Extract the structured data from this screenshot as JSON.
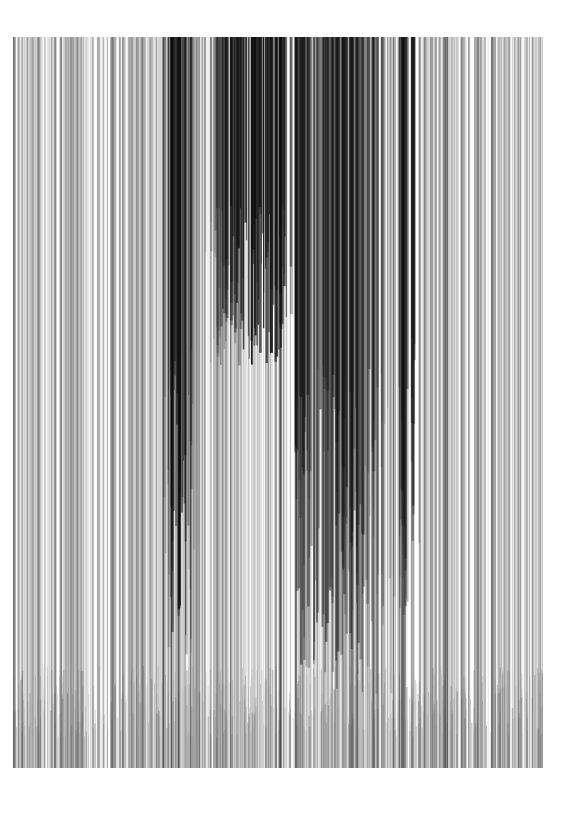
{
  "artwork": {
    "title": "",
    "background": "#ffffff",
    "frame": {
      "x": 13,
      "y": 37,
      "width": 530,
      "height": 731
    },
    "line_count": 900,
    "seed": 7,
    "dark_zones": [
      {
        "center": 245,
        "spread": 40,
        "weight": 1.0,
        "ink_length": 0.45
      },
      {
        "center": 165,
        "spread": 12,
        "weight": 0.8,
        "ink_length": 0.85
      },
      {
        "center": 310,
        "spread": 60,
        "weight": 0.6,
        "ink_length": 0.9
      },
      {
        "center": 395,
        "spread": 10,
        "weight": 0.6,
        "ink_length": 0.8
      }
    ],
    "ink_color": "#111111",
    "base_gray_range": [
      0.08,
      0.45
    ],
    "bottom_fade_band": {
      "from": 0.86,
      "to": 1.0
    }
  }
}
